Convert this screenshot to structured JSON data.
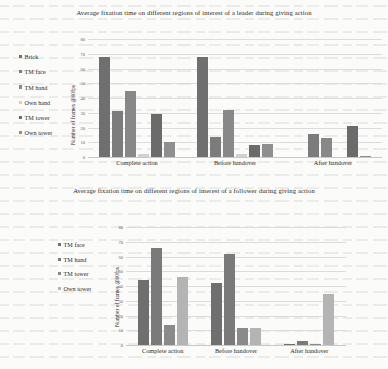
{
  "figures": [
    {
      "id": "leader",
      "title": "Average fixation time on different regions of interest of a leader during giving action",
      "chart_data": {
        "type": "bar",
        "title": "Average fixation time on different regions of interest of a leader during giving action",
        "xlabel": "",
        "ylabel": "Number of frames @60fps",
        "ylim": [
          0,
          80
        ],
        "ytick_step": 10,
        "yticks": [
          "0",
          "10",
          "20",
          "30",
          "40",
          "50",
          "60",
          "70",
          "80"
        ],
        "grid": true,
        "legend_position": "left",
        "categories": [
          "Complete action",
          "Before handover",
          "After handover"
        ],
        "series": [
          {
            "name": "Brick",
            "color": "#6f6f6f",
            "values": [
              68,
              68,
              0
            ]
          },
          {
            "name": "TM face",
            "color": "#7c7c7c",
            "values": [
              31,
              14,
              16
            ]
          },
          {
            "name": "TM hand",
            "color": "#888888",
            "values": [
              45,
              32,
              13
            ]
          },
          {
            "name": "Own hand",
            "color": "#d2d2d2",
            "values": [
              2,
              2,
              0
            ]
          },
          {
            "name": "TM tower",
            "color": "#6b6b6b",
            "values": [
              29,
              8,
              21
            ]
          },
          {
            "name": "Own tower",
            "color": "#8f8f8f",
            "values": [
              10,
              9,
              1
            ]
          }
        ]
      }
    },
    {
      "id": "follower",
      "title": "Average fixation time on different regions of interest of a follower during giving action",
      "chart_data": {
        "type": "bar",
        "title": "Average fixation time on different regions of interest of a follower during giving action",
        "xlabel": "",
        "ylabel": "Number of frames @60fps",
        "ylim": [
          0,
          80
        ],
        "ytick_step": 10,
        "yticks": [
          "0",
          "10",
          "20",
          "30",
          "40",
          "50",
          "60",
          "70",
          "80"
        ],
        "grid": true,
        "legend_position": "left",
        "categories": [
          "Complete action",
          "Before handover",
          "After handover"
        ],
        "series": [
          {
            "name": "TM face",
            "color": "#6f6f6f",
            "values": [
              44,
              42,
              0.5
            ]
          },
          {
            "name": "TM hand",
            "color": "#7a7a7a",
            "values": [
              66,
              62,
              3
            ]
          },
          {
            "name": "TM tower",
            "color": "#8a8a8a",
            "values": [
              14,
              12,
              0.5
            ]
          },
          {
            "name": "Own tower",
            "color": "#b4b4b4",
            "values": [
              46,
              12,
              35
            ]
          }
        ]
      }
    }
  ]
}
